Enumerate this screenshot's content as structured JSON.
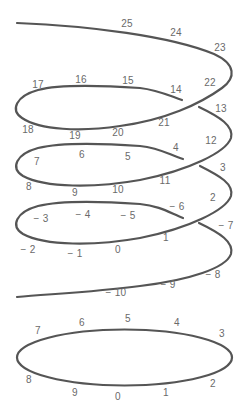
{
  "diagram": {
    "stroke_color": "#555555",
    "label_color": "#6a6a6a",
    "spiral_labels": [
      {
        "text": "25",
        "x": 127,
        "y": 24
      },
      {
        "text": "24",
        "x": 176,
        "y": 33
      },
      {
        "text": "23",
        "x": 220,
        "y": 48
      },
      {
        "text": "22",
        "x": 210,
        "y": 83
      },
      {
        "text": "14",
        "x": 176,
        "y": 90
      },
      {
        "text": "15",
        "x": 128,
        "y": 81
      },
      {
        "text": "16",
        "x": 81,
        "y": 80
      },
      {
        "text": "17",
        "x": 38,
        "y": 85
      },
      {
        "text": "13",
        "x": 221,
        "y": 109
      },
      {
        "text": "18",
        "x": 28,
        "y": 130
      },
      {
        "text": "19",
        "x": 75,
        "y": 136
      },
      {
        "text": "20",
        "x": 118,
        "y": 133
      },
      {
        "text": "21",
        "x": 164,
        "y": 123
      },
      {
        "text": "12",
        "x": 211,
        "y": 141
      },
      {
        "text": "7",
        "x": 37,
        "y": 162
      },
      {
        "text": "6",
        "x": 82,
        "y": 155
      },
      {
        "text": "5",
        "x": 128,
        "y": 157
      },
      {
        "text": "4",
        "x": 176,
        "y": 148
      },
      {
        "text": "3",
        "x": 223,
        "y": 168
      },
      {
        "text": "11",
        "x": 165,
        "y": 181
      },
      {
        "text": "8",
        "x": 29,
        "y": 187
      },
      {
        "text": "9",
        "x": 75,
        "y": 193
      },
      {
        "text": "10",
        "x": 118,
        "y": 190
      },
      {
        "text": "2",
        "x": 213,
        "y": 198
      },
      {
        "text": "− 6",
        "x": 177,
        "y": 207
      },
      {
        "text": "− 3",
        "x": 41,
        "y": 219
      },
      {
        "text": "− 4",
        "x": 83,
        "y": 215
      },
      {
        "text": "− 5",
        "x": 128,
        "y": 216
      },
      {
        "text": "− 7",
        "x": 226,
        "y": 226
      },
      {
        "text": "1",
        "x": 166,
        "y": 238
      },
      {
        "text": "− 2",
        "x": 28,
        "y": 250
      },
      {
        "text": "− 1",
        "x": 75,
        "y": 254
      },
      {
        "text": "0",
        "x": 118,
        "y": 250
      },
      {
        "text": "− 8",
        "x": 213,
        "y": 275
      },
      {
        "text": "− 9",
        "x": 168,
        "y": 285
      },
      {
        "text": "− 10",
        "x": 116,
        "y": 293
      }
    ],
    "ring_labels": [
      {
        "text": "7",
        "x": 38,
        "y": 331
      },
      {
        "text": "6",
        "x": 82,
        "y": 323
      },
      {
        "text": "5",
        "x": 128,
        "y": 319
      },
      {
        "text": "4",
        "x": 177,
        "y": 323
      },
      {
        "text": "3",
        "x": 222,
        "y": 334
      },
      {
        "text": "8",
        "x": 29,
        "y": 380
      },
      {
        "text": "9",
        "x": 75,
        "y": 393
      },
      {
        "text": "0",
        "x": 118,
        "y": 397
      },
      {
        "text": "1",
        "x": 166,
        "y": 393
      },
      {
        "text": "2",
        "x": 213,
        "y": 384
      }
    ]
  }
}
